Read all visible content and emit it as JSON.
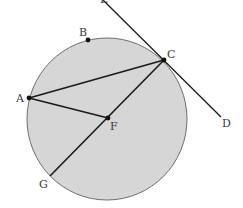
{
  "diagram": {
    "type": "geometry",
    "circle": {
      "cx": 107,
      "cy": 119,
      "rx": 80,
      "ry": 81,
      "fill": "#d6d6d6",
      "stroke": "#6e6e6e"
    },
    "line_color": "#1a1a1a",
    "points": {
      "A": {
        "label": "A",
        "x": 29,
        "y": 98
      },
      "B": {
        "label": "B",
        "x": 88,
        "y": 40
      },
      "C": {
        "label": "C",
        "x": 164,
        "y": 60
      },
      "D": {
        "label": "D",
        "x": 221,
        "y": 117
      },
      "E": {
        "label": "E",
        "x": 103,
        "y": 0
      },
      "F": {
        "label": "F",
        "x": 108,
        "y": 118
      },
      "G": {
        "label": "G",
        "x": 50,
        "y": 176
      }
    },
    "segments": [
      {
        "from": "A",
        "to": "C"
      },
      {
        "from": "A",
        "to": "F"
      },
      {
        "from": "C",
        "to": "G"
      },
      {
        "from": "E",
        "to": "D"
      }
    ],
    "labels": {
      "A": "A",
      "B": "B",
      "C": "C",
      "D": "D",
      "E": "E",
      "F": "F",
      "G": "G"
    }
  }
}
